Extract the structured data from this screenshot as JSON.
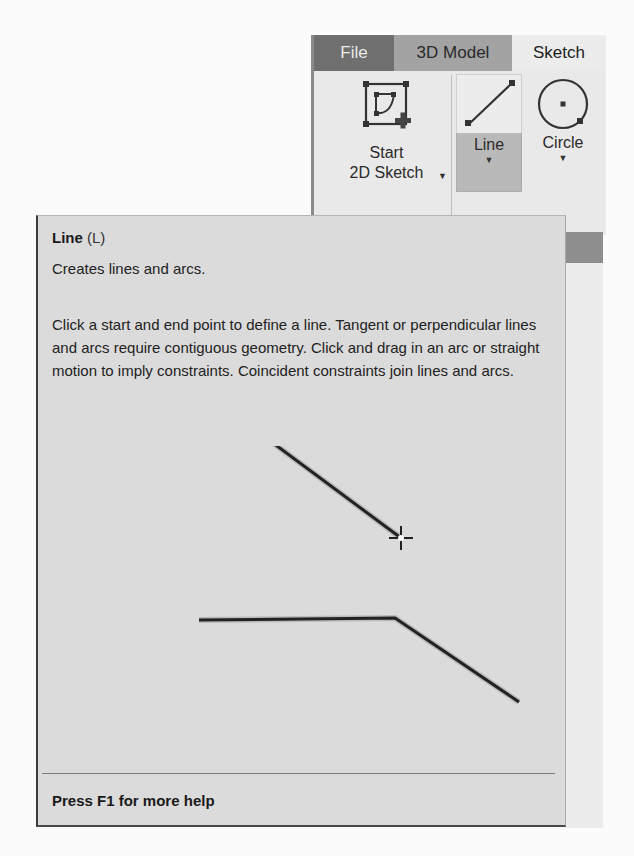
{
  "ribbon": {
    "tabs": [
      {
        "label": "File",
        "state": "normal"
      },
      {
        "label": "3D Model",
        "state": "normal"
      },
      {
        "label": "Sketch",
        "state": "active"
      }
    ],
    "tools": [
      {
        "label_line1": "Start",
        "label_line2": "2D Sketch",
        "icon": "start-2d-sketch-icon",
        "has_dropdown": true
      },
      {
        "label": "Line",
        "icon": "line-icon",
        "has_dropdown": true,
        "state": "hovered"
      },
      {
        "label": "Circle",
        "icon": "circle-icon",
        "has_dropdown": true
      }
    ],
    "group_label": "Sketch"
  },
  "tooltip": {
    "title": "Line",
    "shortcut": "(L)",
    "summary": "Creates lines and arcs.",
    "description": "Click a start and end point to define a line. Tangent or perpendicular lines and arcs require contiguous geometry. Click and drag in an arc or straight motion to imply constraints. Coincident constraints join lines and arcs.",
    "footer": "Press F1 for more help"
  },
  "colors": {
    "tab_file_bg": "#6f6f6f",
    "tab_model_bg": "#a3a3a3",
    "tab_sketch_bg": "#ececec",
    "line_tool_highlight": "#b9b9b9",
    "tooltip_bg": "#dbdbdb"
  }
}
